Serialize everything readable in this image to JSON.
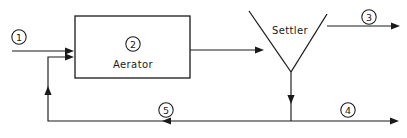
{
  "diagram": {
    "canvas": {
      "width": 407,
      "height": 138,
      "background": "#ffffff"
    },
    "line_color": "#1a1a1a",
    "units": [
      {
        "id": "unit-2",
        "tag": "2",
        "label": "Aerator",
        "shape": "rectangle",
        "tag_cx": 133,
        "tag_cy": 44,
        "label_x": 133,
        "label_y": 64,
        "rect": {
          "x": 75,
          "y": 16,
          "width": 115,
          "height": 62
        }
      },
      {
        "id": "unit-settler",
        "tag": "",
        "label": "Settler",
        "shape": "v-clarifier",
        "label_x": 290,
        "label_y": 30,
        "apex_x": 291,
        "apex_y": 72,
        "left_top_x": 249,
        "left_top_y": 11,
        "right_top_x": 327,
        "right_top_y": 14
      }
    ],
    "streams": [
      {
        "id": "stream-1",
        "tag": "1",
        "name": "influent-stream",
        "direction": "right",
        "tag_cx": 19,
        "tag_cy": 37,
        "path": "M 12 51 L 73 51",
        "arrow_x": 73,
        "arrow_y": 51
      },
      {
        "id": "stream-aerator-outlet",
        "tag": "",
        "name": "aerator-outlet-stream",
        "direction": "right",
        "path": "M 190 50 L 263 50",
        "arrow_x": 263,
        "arrow_y": 50
      },
      {
        "id": "stream-3",
        "tag": "3",
        "name": "effluent-stream",
        "direction": "right",
        "tag_cx": 369,
        "tag_cy": 17,
        "path": "M 327 26 L 400 26",
        "arrow_x": 400,
        "arrow_y": 26
      },
      {
        "id": "stream-underflow",
        "tag": "",
        "name": "settler-underflow-stream",
        "direction": "down",
        "path": "M 291 72 L 291 121",
        "arrow_x": 291,
        "arrow_y": 103
      },
      {
        "id": "stream-4",
        "tag": "4",
        "name": "waste-sludge-stream",
        "direction": "right",
        "tag_cx": 348,
        "tag_cy": 110,
        "path": "M 291 121 L 399 121",
        "arrow_x": 399,
        "arrow_y": 121
      },
      {
        "id": "stream-5",
        "tag": "5",
        "name": "recycle-sludge-stream",
        "direction": "left",
        "tag_cx": 166,
        "tag_cy": 110,
        "path": "M 291 121 L 48 121 L 48 57 L 73 57",
        "arrow_x": 166,
        "arrow_y": 121,
        "arrow2_x": 48,
        "arrow2_y": 88,
        "arrow3_x": 73,
        "arrow3_y": 57
      }
    ]
  }
}
